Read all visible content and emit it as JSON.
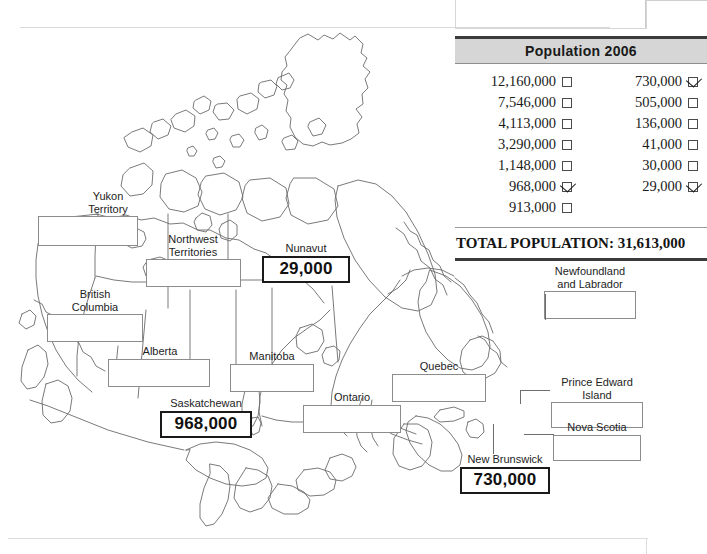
{
  "worksheet": {
    "title_visible": false
  },
  "population_table": {
    "header": "Population 2006",
    "rows_left": [
      {
        "value": "12,160,000",
        "checked": false
      },
      {
        "value": "7,546,000",
        "checked": false
      },
      {
        "value": "4,113,000",
        "checked": false
      },
      {
        "value": "3,290,000",
        "checked": false
      },
      {
        "value": "1,148,000",
        "checked": false
      },
      {
        "value": "968,000",
        "checked": true
      },
      {
        "value": "913,000",
        "checked": false
      }
    ],
    "rows_right": [
      {
        "value": "730,000",
        "checked": true
      },
      {
        "value": "505,000",
        "checked": false
      },
      {
        "value": "136,000",
        "checked": false
      },
      {
        "value": "41,000",
        "checked": false
      },
      {
        "value": "30,000",
        "checked": false
      },
      {
        "value": "29,000",
        "checked": true
      },
      {
        "value": "",
        "checked": null
      }
    ],
    "total_label": "TOTAL POPULATION: 31,613,000",
    "header_bg": "#d6d6d6",
    "rule_color": "#3b3b3b"
  },
  "map": {
    "region": "Canada",
    "provinces": [
      {
        "name": "yukon-territory",
        "label": "Yukon\nTerritory",
        "answer": "",
        "filled": false
      },
      {
        "name": "northwest-territories",
        "label": "Northwest\nTerritories",
        "answer": "",
        "filled": false
      },
      {
        "name": "nunavut",
        "label": "Nunavut",
        "answer": "29,000",
        "filled": true
      },
      {
        "name": "british-columbia",
        "label": "British\nColumbia",
        "answer": "",
        "filled": false
      },
      {
        "name": "alberta",
        "label": "Alberta",
        "answer": "",
        "filled": false
      },
      {
        "name": "saskatchewan",
        "label": "Saskatchewan",
        "answer": "968,000",
        "filled": true
      },
      {
        "name": "manitoba",
        "label": "Manitoba",
        "answer": "",
        "filled": false
      },
      {
        "name": "ontario",
        "label": "Ontario",
        "answer": "",
        "filled": false
      },
      {
        "name": "quebec",
        "label": "Quebec",
        "answer": "",
        "filled": false
      },
      {
        "name": "newfoundland-and-labrador",
        "label": "Newfoundland\nand Labrador",
        "answer": "",
        "filled": false
      },
      {
        "name": "prince-edward-island",
        "label": "Prince Edward Island",
        "answer": "",
        "filled": false
      },
      {
        "name": "nova-scotia",
        "label": "Nova Scotia",
        "answer": "",
        "filled": false
      },
      {
        "name": "new-brunswick",
        "label": "New Brunswick",
        "answer": "730,000",
        "filled": true
      }
    ],
    "outline_color": "#6b6b6b"
  }
}
